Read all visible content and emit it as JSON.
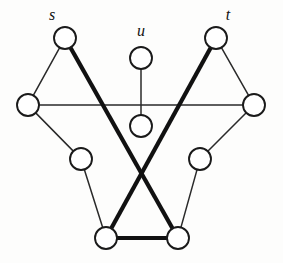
{
  "figure": {
    "background_color": "#fdfdfc",
    "node_fill": "#ffffff",
    "node_stroke": "#1a1a1a",
    "thin_edge_color": "#2a2a2a",
    "thick_edge_color": "#111111",
    "width": 283,
    "height": 263
  },
  "labels": {
    "s": "s",
    "u": "u",
    "t": "t"
  },
  "graph_data": {
    "type": "node-link-diagram",
    "node_radius": 11,
    "nodes": [
      {
        "id": "s",
        "label": "s",
        "cx": 65,
        "cy": 38,
        "label_x": 52,
        "label_y": 20
      },
      {
        "id": "u",
        "label": "u",
        "cx": 141,
        "cy": 58,
        "label_x": 141,
        "label_y": 36
      },
      {
        "id": "t",
        "label": "t",
        "cx": 216,
        "cy": 38,
        "label_x": 228,
        "label_y": 20
      },
      {
        "id": "l",
        "label": "",
        "cx": 28,
        "cy": 105,
        "label_x": 0,
        "label_y": 0
      },
      {
        "id": "u2",
        "label": "",
        "cx": 141,
        "cy": 126,
        "label_x": 0,
        "label_y": 0
      },
      {
        "id": "r",
        "label": "",
        "cx": 254,
        "cy": 105,
        "label_x": 0,
        "label_y": 0
      },
      {
        "id": "ml",
        "label": "",
        "cx": 81,
        "cy": 159,
        "label_x": 0,
        "label_y": 0
      },
      {
        "id": "mr",
        "label": "",
        "cx": 200,
        "cy": 159,
        "label_x": 0,
        "label_y": 0
      },
      {
        "id": "bl",
        "label": "",
        "cx": 106,
        "cy": 238,
        "label_x": 0,
        "label_y": 0
      },
      {
        "id": "br",
        "label": "",
        "cx": 178,
        "cy": 238,
        "label_x": 0,
        "label_y": 0
      }
    ],
    "edges": [
      {
        "from": "s",
        "to": "l",
        "weight": "thin"
      },
      {
        "from": "l",
        "to": "ml",
        "weight": "thin"
      },
      {
        "from": "l",
        "to": "r",
        "weight": "thin"
      },
      {
        "from": "t",
        "to": "r",
        "weight": "thin"
      },
      {
        "from": "r",
        "to": "mr",
        "weight": "thin"
      },
      {
        "from": "u",
        "to": "u2",
        "weight": "thin"
      },
      {
        "from": "ml",
        "to": "bl",
        "weight": "thin"
      },
      {
        "from": "mr",
        "to": "br",
        "weight": "thin"
      },
      {
        "from": "s",
        "to": "br",
        "weight": "thick"
      },
      {
        "from": "t",
        "to": "bl",
        "weight": "thick"
      },
      {
        "from": "bl",
        "to": "br",
        "weight": "thick"
      }
    ],
    "highlighted_path": [
      "s",
      "br",
      "bl",
      "t"
    ],
    "legend": "Thick edges mark the augmenting path between s and t"
  }
}
